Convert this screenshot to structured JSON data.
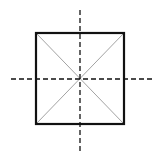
{
  "diagram": {
    "title": "",
    "colors": {
      "background": "#ffffff",
      "square_stroke": "#111111",
      "diagonal_stroke": "#888888",
      "axis_stroke": "#111111"
    },
    "square": {
      "x1": 36,
      "y1": 33,
      "x2": 124,
      "y2": 124
    },
    "center": {
      "x": 80,
      "y": 79
    },
    "vertical_axis": {
      "x": 80,
      "y1": 10,
      "y2": 152,
      "style": "dashed"
    },
    "horizontal_axis": {
      "y": 79,
      "x1": 11,
      "x2": 154,
      "style": "dashed"
    },
    "diagonals": [
      {
        "from": "top-left",
        "to": "bottom-right"
      },
      {
        "from": "top-right",
        "to": "bottom-left"
      }
    ]
  }
}
